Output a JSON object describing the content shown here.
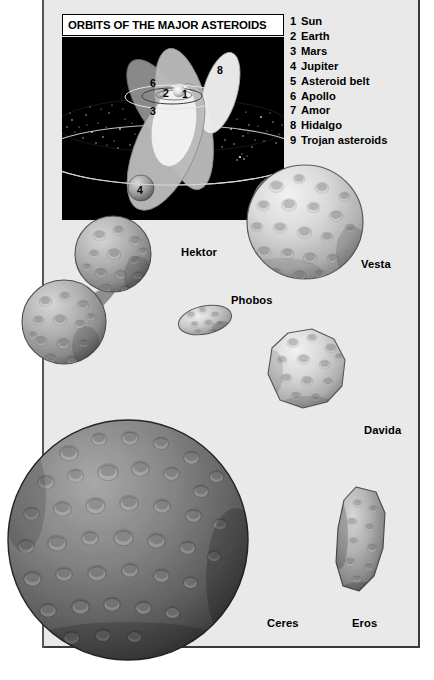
{
  "page": {
    "background_color": "#ffffff",
    "panel_color": "#e9e9e9",
    "border_color": "#3a3a3a"
  },
  "diagram": {
    "title": "ORBITS OF THE MAJOR ASTEROIDS",
    "background_color": "#000000",
    "markers": [
      {
        "id": "1",
        "label": "Sun",
        "x": 120,
        "y": 57
      },
      {
        "id": "2",
        "label": "Earth",
        "x": 104,
        "y": 55
      },
      {
        "id": "3",
        "label": "Mars",
        "x": 90,
        "y": 73
      },
      {
        "id": "4",
        "label": "Jupiter",
        "x": 82,
        "y": 157
      },
      {
        "id": "6",
        "label": "Apollo",
        "x": 90,
        "y": 45
      },
      {
        "id": "7",
        "label": "Amor",
        "x": 188,
        "y": 28
      },
      {
        "id": "8",
        "label": "Hidalgo",
        "x": 157,
        "y": 33
      }
    ]
  },
  "legend": {
    "items": [
      {
        "num": "1",
        "label": "Sun"
      },
      {
        "num": "2",
        "label": "Earth"
      },
      {
        "num": "3",
        "label": "Mars"
      },
      {
        "num": "4",
        "label": "Jupiter"
      },
      {
        "num": "5",
        "label": "Asteroid belt"
      },
      {
        "num": "6",
        "label": "Apollo"
      },
      {
        "num": "7",
        "label": "Amor"
      },
      {
        "num": "8",
        "label": "Hidalgo"
      },
      {
        "num": "9",
        "label": "Trojan asteroids"
      }
    ]
  },
  "figures": {
    "hektor": "Hektor",
    "vesta": "Vesta",
    "phobos": "Phobos",
    "davida": "Davida",
    "ceres": "Ceres",
    "eros": "Eros"
  }
}
